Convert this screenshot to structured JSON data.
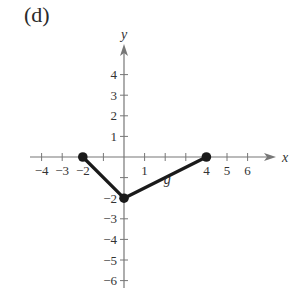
{
  "panel_label": "(d)",
  "chart_data": {
    "type": "line",
    "title": "",
    "xlabel": "x",
    "ylabel": "y",
    "xlim": [
      -4.5,
      7
    ],
    "ylim": [
      -6.5,
      5
    ],
    "x_ticks": [
      -4,
      -3,
      -2,
      -1,
      1,
      2,
      3,
      4,
      5,
      6
    ],
    "x_tick_labels": [
      "-4",
      "-3",
      "-2",
      "",
      "1",
      "",
      "",
      "4",
      "5",
      "6"
    ],
    "y_ticks": [
      4,
      3,
      2,
      1,
      -1,
      -2,
      -3,
      -4,
      -5,
      -6
    ],
    "y_tick_labels": [
      "4",
      "3",
      "2",
      "1",
      "",
      "-2",
      "-3",
      "-4",
      "-5",
      "-6"
    ],
    "grid": false,
    "series": [
      {
        "name": "g",
        "x": [
          -2,
          0,
          4
        ],
        "y": [
          0,
          -2,
          0
        ],
        "endpoints_filled": true
      }
    ],
    "annotations": [
      {
        "text": "g",
        "x": 2.1,
        "y": -1.3
      }
    ]
  },
  "layout": {
    "origin_px": [
      124,
      157
    ],
    "unit_px": 20.6,
    "x_axis_px": [
      30,
      276
    ],
    "y_axis_px": [
      44,
      288
    ],
    "line_color": "#1a1a1a",
    "axis_color": "#777777"
  }
}
